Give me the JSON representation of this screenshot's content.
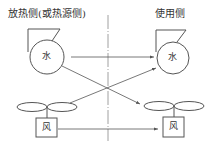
{
  "labels": {
    "left_side": "放热侧(或热源侧)",
    "right_side": "使用侧"
  },
  "nodes": {
    "left_pump": "水",
    "right_pump": "水",
    "left_fan": "风",
    "right_fan": "风"
  },
  "edges": [
    {
      "from": "left_pump",
      "to": "right_pump"
    },
    {
      "from": "left_pump",
      "to": "right_fan"
    },
    {
      "from": "left_fan",
      "to": "right_pump"
    },
    {
      "from": "left_fan",
      "to": "right_fan"
    }
  ],
  "colors": {
    "stroke": "#555555",
    "text": "#333333",
    "centerline": "#888888"
  }
}
